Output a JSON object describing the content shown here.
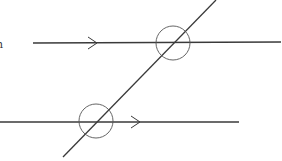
{
  "diagram": {
    "type": "parallel-lines-transversal",
    "partial_label": "n",
    "stroke_color": "#3a3a3a",
    "background": "#ffffff",
    "lines": [
      {
        "name": "top-parallel-line",
        "x1": 33,
        "y1": 43,
        "x2": 281,
        "y2": 42
      },
      {
        "name": "bottom-parallel-line",
        "x1": 0,
        "y1": 122,
        "x2": 239,
        "y2": 122
      },
      {
        "name": "transversal-line",
        "x1": 216,
        "y1": 0,
        "x2": 63,
        "y2": 157
      }
    ],
    "arrows": [
      {
        "name": "top-parallel-arrow",
        "tip_x": 97,
        "tip_y": 43
      },
      {
        "name": "bottom-parallel-arrow",
        "tip_x": 140,
        "tip_y": 122
      }
    ],
    "circles": [
      {
        "name": "top-intersection-circle",
        "cx": 173,
        "cy": 43,
        "r": 17
      },
      {
        "name": "bottom-intersection-circle",
        "cx": 96,
        "cy": 121,
        "r": 17
      }
    ]
  }
}
